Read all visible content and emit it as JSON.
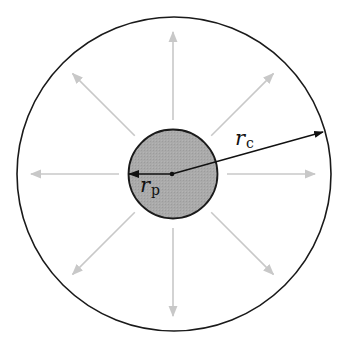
{
  "diagram": {
    "outer_circle": {
      "cx": 174,
      "cy": 174,
      "r": 157,
      "stroke": "#1a1a1a"
    },
    "inner_circle": {
      "cx": 173,
      "cy": 174,
      "r": 44.5,
      "fill": "#aaaaaa",
      "stroke": "#1a1a1a"
    },
    "center_dot": {
      "cx": 172,
      "cy": 174
    },
    "radial_arrows": {
      "count": 8,
      "r_start": 54,
      "r_end": 142,
      "color": "#c8c8c8"
    },
    "labels": {
      "rc": {
        "main": "r",
        "sub": "c"
      },
      "rp": {
        "main": "r",
        "sub": "p"
      }
    },
    "rc_arrow": {
      "x1": 172,
      "y1": 174,
      "x2": 323,
      "y2": 132
    },
    "rp_arrow": {
      "x1": 172,
      "y1": 174,
      "x2": 129,
      "y2": 174
    }
  }
}
